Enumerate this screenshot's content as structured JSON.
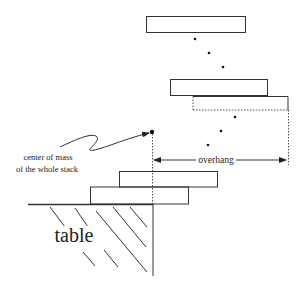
{
  "diagram": {
    "labels": {
      "com_line1": "center of mass",
      "com_line2": "of the whole stack",
      "overhang": "overhang",
      "table": "table"
    },
    "colors": {
      "stroke": "#333333",
      "background": "#ffffff"
    },
    "blocks": [
      {
        "name": "top-block",
        "x": 146,
        "y": 16,
        "w": 100,
        "h": 17,
        "style": "solid"
      },
      {
        "name": "second-block",
        "x": 170,
        "y": 79,
        "w": 98,
        "h": 17,
        "style": "solid"
      },
      {
        "name": "third-block",
        "x": 193,
        "y": 96,
        "w": 95,
        "h": 14,
        "style": "dashed-bottom"
      },
      {
        "name": "fourth-block",
        "x": 119,
        "y": 171,
        "w": 99,
        "h": 16,
        "style": "solid"
      },
      {
        "name": "bottom-block",
        "x": 90,
        "y": 187,
        "w": 99,
        "h": 17,
        "style": "solid"
      }
    ],
    "ellipsis_dots": [
      {
        "x": 195,
        "y": 39
      },
      {
        "x": 209,
        "y": 53
      },
      {
        "x": 223,
        "y": 67
      },
      {
        "x": 235,
        "y": 117
      },
      {
        "x": 221,
        "y": 131
      },
      {
        "x": 208,
        "y": 145
      }
    ],
    "center_of_mass": {
      "x": 152,
      "y": 132
    }
  }
}
